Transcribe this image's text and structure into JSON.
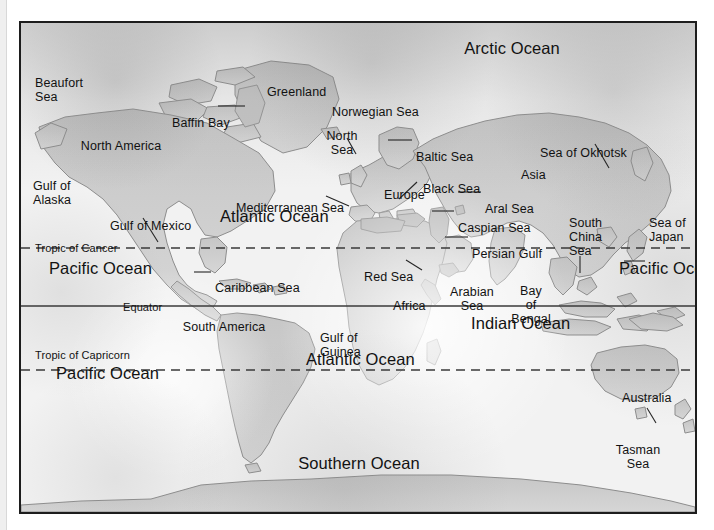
{
  "document": {
    "type": "world-map-figure",
    "title": "World Map with Oceans, Seas and Continents",
    "background_color": "#ffffff",
    "frame_color": "#1d1d1d",
    "land_fill": "#cfcfcf",
    "land_stroke": "#8a8a8a",
    "ocean_fill": "#f2f2f2",
    "text_color": "#121212"
  },
  "reference_lines": [
    {
      "name": "Tropic of Cancer",
      "label": "Tropic of Cancer",
      "style": "dashed",
      "y": 247
    },
    {
      "name": "Equator",
      "label": "Equator",
      "style": "solid",
      "y": 305
    },
    {
      "name": "Tropic of Capricorn",
      "label": "Tropic of Capricorn",
      "style": "dashed",
      "y": 369
    }
  ],
  "oceans": [
    {
      "id": "arctic-ocean",
      "label": "Arctic Ocean",
      "x": 510,
      "y": 37,
      "size": "large"
    },
    {
      "id": "atlantic-ocean-north",
      "label": "Atlantic Ocean",
      "x": 237,
      "y": 205,
      "size": "large"
    },
    {
      "id": "atlantic-ocean-south",
      "label": "Atlantic Ocean",
      "x": 322,
      "y": 348,
      "size": "large"
    },
    {
      "id": "pacific-ocean-north-west",
      "label": "Pacific Ocean",
      "x": 22,
      "y": 257,
      "size": "large"
    },
    {
      "id": "pacific-ocean-south-west",
      "label": "Pacific Ocean",
      "x": 28,
      "y": 362,
      "size": "large"
    },
    {
      "id": "pacific-ocean-east",
      "label": "Pacific Ocean",
      "x": 630,
      "y": 257,
      "size": "large"
    },
    {
      "id": "indian-ocean",
      "label": "Indian Ocean",
      "x": 479,
      "y": 312,
      "size": "large"
    },
    {
      "id": "southern-ocean",
      "label": "Southern Ocean",
      "x": 357,
      "y": 452,
      "size": "large"
    }
  ],
  "continents": [
    {
      "id": "north-america",
      "label": "North America",
      "x": 119,
      "y": 137
    },
    {
      "id": "south-america",
      "label": "South America",
      "x": 222,
      "y": 318
    },
    {
      "id": "europe",
      "label": "Europe",
      "x": 382,
      "y": 172
    },
    {
      "id": "africa",
      "label": "Africa",
      "x": 391,
      "y": 283
    },
    {
      "id": "asia",
      "label": "Asia",
      "x": 519,
      "y": 152
    },
    {
      "id": "australia",
      "label": "Australia",
      "x": 620,
      "y": 375
    },
    {
      "id": "antarctica",
      "label": "Antarctica",
      "x": 422,
      "y": 495
    },
    {
      "id": "greenland",
      "label": "Greenland",
      "x": 265,
      "y": 69
    }
  ],
  "seas": [
    {
      "id": "beaufort-sea",
      "label": "Beaufort\nSea",
      "x": 33,
      "y": 60
    },
    {
      "id": "baffin-bay",
      "label": "Baffin Bay",
      "x": 170,
      "y": 100,
      "leader": {
        "x1": 216,
        "y1": 104,
        "x2": 243,
        "y2": 104
      }
    },
    {
      "id": "norwegian-sea",
      "label": "Norwegian Sea",
      "x": 330,
      "y": 89
    },
    {
      "id": "north-sea",
      "label": "North\nSea",
      "x": 320,
      "y": 113,
      "leader": {
        "x1": 345,
        "y1": 136,
        "x2": 354,
        "y2": 152
      }
    },
    {
      "id": "baltic-sea",
      "label": "Baltic Sea",
      "x": 414,
      "y": 134,
      "leader": {
        "x1": 386,
        "y1": 138,
        "x2": 410,
        "y2": 138
      }
    },
    {
      "id": "sea-of-okhotsk",
      "label": "Sea of Okhotsk",
      "x": 538,
      "y": 130,
      "leader": {
        "x1": 593,
        "y1": 142,
        "x2": 607,
        "y2": 166
      }
    },
    {
      "id": "gulf-of-alaska",
      "label": "Gulf of\nAlaska",
      "x": 31,
      "y": 163
    },
    {
      "id": "black-sea",
      "label": "Black Sea",
      "x": 421,
      "y": 166,
      "leader": {
        "x1": 415,
        "y1": 180,
        "x2": 397,
        "y2": 197
      }
    },
    {
      "id": "mediterranean-sea",
      "label": "Mediterranean Sea",
      "x": 234,
      "y": 185,
      "leader": {
        "x1": 324,
        "y1": 194,
        "x2": 347,
        "y2": 204
      }
    },
    {
      "id": "aral-sea",
      "label": "Aral Sea",
      "x": 483,
      "y": 186,
      "leader": {
        "x1": 456,
        "y1": 190,
        "x2": 479,
        "y2": 190
      }
    },
    {
      "id": "gulf-of-mexico",
      "label": "Gulf of Mexico",
      "x": 108,
      "y": 203,
      "leader": {
        "x1": 141,
        "y1": 216,
        "x2": 156,
        "y2": 240
      }
    },
    {
      "id": "caspian-sea",
      "label": "Caspian Sea",
      "x": 456,
      "y": 205,
      "leader": {
        "x1": 430,
        "y1": 209,
        "x2": 452,
        "y2": 209
      }
    },
    {
      "id": "south-china-sea",
      "label": "South\nChina\nSea",
      "x": 562,
      "y": 200,
      "leader": {
        "x1": 578,
        "y1": 254,
        "x2": 578,
        "y2": 271
      }
    },
    {
      "id": "sea-of-japan",
      "label": "Sea of\nJapan",
      "x": 645,
      "y": 200,
      "leader": {
        "x1": 622,
        "y1": 259,
        "x2": 643,
        "y2": 259
      }
    },
    {
      "id": "persian-gulf",
      "label": "Persian Gulf",
      "x": 470,
      "y": 231,
      "leader": {
        "x1": 443,
        "y1": 235,
        "x2": 466,
        "y2": 235
      }
    },
    {
      "id": "red-sea",
      "label": "Red Sea",
      "x": 366,
      "y": 254,
      "leader": {
        "x1": 404,
        "y1": 258,
        "x2": 420,
        "y2": 268
      }
    },
    {
      "id": "caribbean-sea",
      "label": "Caribbean Sea",
      "x": 212,
      "y": 265,
      "leader": {
        "x1": 192,
        "y1": 270,
        "x2": 209,
        "y2": 270
      }
    },
    {
      "id": "arabian-sea",
      "label": "Arabian\nSea",
      "x": 450,
      "y": 269
    },
    {
      "id": "bay-of-bengal",
      "label": "Bay\nof\nBengal",
      "x": 509,
      "y": 268
    },
    {
      "id": "gulf-of-guinea",
      "label": "Gulf of\nGuinea",
      "x": 317,
      "y": 315
    },
    {
      "id": "tasman-sea",
      "label": "Tasman\nSea",
      "x": 615,
      "y": 427,
      "leader": {
        "x1": 645,
        "y1": 406,
        "x2": 654,
        "y2": 421
      }
    }
  ]
}
